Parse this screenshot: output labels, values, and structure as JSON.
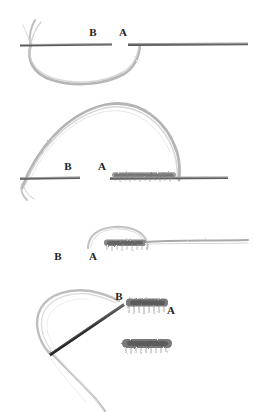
{
  "figure": {
    "background_color": "#ffffff",
    "width": 254,
    "height": 412,
    "ink_colors": {
      "needle_light": "#8f8f8f",
      "needle_dark": "#3a3a3a",
      "thread_light": "#b9b9b9",
      "thread_mid": "#9a9a9a",
      "stitch_dark": "#6f6f6f",
      "label": "#222222"
    }
  },
  "panels": [
    {
      "id": "panel-1",
      "name": "needle-entering-fabric",
      "labels": [
        {
          "text": "B",
          "x": 93,
          "y": 36
        },
        {
          "text": "A",
          "x": 123,
          "y": 36
        }
      ],
      "needle": {
        "left_start_x": 20,
        "left_end_x": 112,
        "right_start_x": 128,
        "right_end_x": 248,
        "y": 44
      },
      "thread": {
        "loop_bottom_y": 82,
        "loop_left_x": 32,
        "loop_right_x": 140
      }
    },
    {
      "id": "panel-2",
      "name": "thread-pulled-through-arch",
      "labels": [
        {
          "text": "B",
          "x": 68,
          "y": 170
        },
        {
          "text": "A",
          "x": 102,
          "y": 170
        }
      ],
      "needle": {
        "left_start_x": 20,
        "left_end_x": 80,
        "right_start_x": 110,
        "right_end_x": 228,
        "y": 178
      },
      "arch": {
        "peak_x": 110,
        "peak_y": 104,
        "left_foot_x": 22,
        "right_foot_x": 178
      },
      "stitch_band": {
        "x_start": 112,
        "x_end": 176,
        "y": 176
      }
    },
    {
      "id": "panel-3",
      "name": "stitch-tightened",
      "labels": [
        {
          "text": "B",
          "x": 58,
          "y": 260
        },
        {
          "text": "A",
          "x": 93,
          "y": 260
        }
      ],
      "stitch_band": {
        "x_start": 104,
        "x_end": 146,
        "y": 245
      },
      "thread_tail": {
        "x_start": 146,
        "x_end": 248,
        "y": 242
      }
    },
    {
      "id": "panel-4",
      "name": "needle-reinserted-next-stitch",
      "labels": [
        {
          "text": "B",
          "x": 119,
          "y": 300
        },
        {
          "text": "A",
          "x": 171,
          "y": 314
        }
      ],
      "needle": {
        "tip_x": 49,
        "tip_y": 353,
        "eye_x": 124,
        "eye_y": 304
      },
      "stitch_upper": {
        "x_start": 126,
        "x_end": 168,
        "y": 305
      },
      "stitch_lower": {
        "x_start": 122,
        "x_end": 172,
        "y": 345
      },
      "thread_loop": {
        "top_x": 110,
        "top_y": 294,
        "left_x": 36,
        "left_y": 312
      }
    }
  ]
}
